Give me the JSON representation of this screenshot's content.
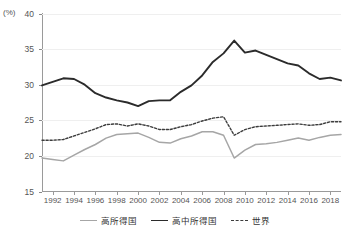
{
  "chart_data": {
    "type": "line",
    "title": "",
    "xlabel": "",
    "ylabel": "(%)",
    "unit_label": "(%)",
    "ylim": [
      15,
      40
    ],
    "yticks": [
      15,
      20,
      25,
      30,
      35,
      40
    ],
    "xlim": [
      1991,
      2019
    ],
    "xticks": [
      1992,
      1994,
      1996,
      1998,
      2000,
      2002,
      2004,
      2006,
      2008,
      2010,
      2012,
      2014,
      2016,
      2018
    ],
    "grid": "horizontal",
    "legend_position": "bottom",
    "x": [
      1991,
      1992,
      1993,
      1994,
      1995,
      1996,
      1997,
      1998,
      1999,
      2000,
      2001,
      2002,
      2003,
      2004,
      2005,
      2006,
      2007,
      2008,
      2009,
      2010,
      2011,
      2012,
      2013,
      2014,
      2015,
      2016,
      2017,
      2018,
      2019
    ],
    "series": [
      {
        "name": "高所得国",
        "style": "solid",
        "color": "#a6a6a6",
        "values": [
          19.7,
          19.5,
          19.3,
          20.1,
          20.9,
          21.6,
          22.5,
          23.0,
          23.1,
          23.2,
          22.6,
          21.9,
          21.8,
          22.4,
          22.8,
          23.4,
          23.4,
          22.9,
          19.7,
          20.8,
          21.6,
          21.7,
          21.9,
          22.2,
          22.5,
          22.2,
          22.6,
          22.9,
          23.0
        ]
      },
      {
        "name": "高中所得国",
        "style": "solid",
        "color": "#2b2b2b",
        "values": [
          29.9,
          30.4,
          30.9,
          30.8,
          30.0,
          28.8,
          28.2,
          27.8,
          27.5,
          27.0,
          27.7,
          27.8,
          27.8,
          29.0,
          29.9,
          31.3,
          33.2,
          34.4,
          36.2,
          34.5,
          34.8,
          34.2,
          33.6,
          33.0,
          32.7,
          31.6,
          30.8,
          31.0,
          30.6
        ]
      },
      {
        "name": "世界",
        "style": "dashed",
        "color": "#3c3c3c",
        "values": [
          22.2,
          22.2,
          22.3,
          22.8,
          23.3,
          23.8,
          24.4,
          24.5,
          24.2,
          24.5,
          24.2,
          23.7,
          23.7,
          24.1,
          24.4,
          24.9,
          25.3,
          25.5,
          22.9,
          23.7,
          24.1,
          24.2,
          24.3,
          24.4,
          24.5,
          24.3,
          24.4,
          24.8,
          24.8
        ]
      }
    ],
    "legend": [
      "高所得国",
      "高中所得国",
      "世界"
    ]
  }
}
